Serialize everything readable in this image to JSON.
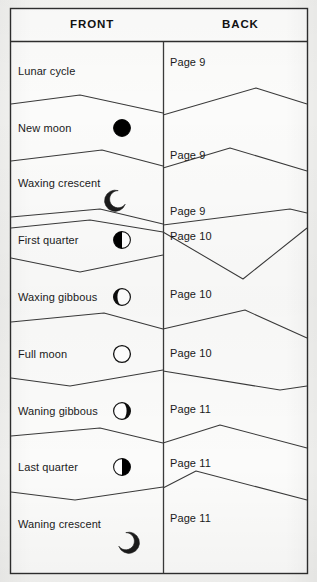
{
  "document": {
    "kind": "flashcard-cut-sheet",
    "background_color": "#f4f4f2",
    "ink_color": "#1a1a1a",
    "line_color": "#3a3a3a"
  },
  "table": {
    "headers": [
      {
        "label": "FRONT",
        "name": "column-header-front"
      },
      {
        "label": "BACK",
        "name": "column-header-back"
      }
    ],
    "rows": [
      {
        "front": "Lunar cycle",
        "back": "Page 9",
        "icon": ""
      },
      {
        "front": "New moon",
        "back": "Page 9",
        "icon": "new-moon-icon"
      },
      {
        "front": "Waxing crescent",
        "back": "Page 9",
        "icon": "waxing-crescent-moon-icon"
      },
      {
        "front": "First quarter",
        "back": "Page 10",
        "icon": "first-quarter-moon-icon"
      },
      {
        "front": "Waxing gibbous",
        "back": "Page 10",
        "icon": "waxing-gibbous-moon-icon"
      },
      {
        "front": "Full moon",
        "back": "Page 10",
        "icon": "full-moon-icon"
      },
      {
        "front": "Waning gibbous",
        "back": "Page 11",
        "icon": "waning-gibbous-moon-icon"
      },
      {
        "front": "Last quarter",
        "back": "Page 11",
        "icon": "last-quarter-moon-icon"
      },
      {
        "front": "Waning crescent",
        "back": "Page 11",
        "icon": "waning-crescent-moon-icon"
      }
    ]
  },
  "geometry": {
    "table_left": 10,
    "table_right": 308,
    "table_top": 8,
    "table_bottom": 574,
    "column_divider_x": 163,
    "header_bottom_y": 41,
    "left_text_x": 18,
    "right_text_x": 170,
    "icon_center_x": 122,
    "row_text_y": [
      71,
      128,
      183,
      240,
      297,
      354,
      411,
      467,
      524
    ],
    "back_text_y": [
      62,
      155,
      211,
      236,
      294,
      353,
      409,
      463,
      518
    ],
    "left_dividers_y": [
      99,
      156,
      212,
      269,
      325,
      382,
      439,
      495
    ],
    "right_dividers_y": [
      143,
      200,
      225,
      282,
      338,
      395,
      452,
      508
    ]
  }
}
